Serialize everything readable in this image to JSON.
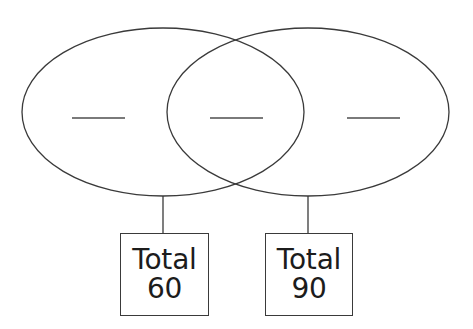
{
  "worksheet": {
    "type": "venn-diagram-fill-in-the-blank",
    "background_color": "#ffffff",
    "stroke_color": "#3a3a3a",
    "text_color": "#1c1c1c",
    "blank_line_color": "#7a7a7a"
  },
  "diagram": {
    "left_ellipse": {
      "label": "left-set-ellipse",
      "cx": 163,
      "cy": 112,
      "rx": 141,
      "ry": 84
    },
    "right_ellipse": {
      "label": "right-set-ellipse",
      "cx": 308,
      "cy": 112,
      "rx": 141,
      "ry": 84
    },
    "blanks": [
      {
        "name": "left-only-blank",
        "value": "",
        "x1": 72,
        "x2": 125,
        "y": 118
      },
      {
        "name": "intersection-blank",
        "value": "",
        "x1": 210,
        "x2": 263,
        "y": 118
      },
      {
        "name": "right-only-blank",
        "value": "",
        "x1": 347,
        "x2": 400,
        "y": 118
      }
    ],
    "connectors": [
      {
        "name": "left-connector",
        "x": 163,
        "y1": 196,
        "y2": 233
      },
      {
        "name": "right-connector",
        "x": 308,
        "y1": 196,
        "y2": 233
      }
    ]
  },
  "totals": {
    "left": {
      "word": "Total",
      "number": "60"
    },
    "right": {
      "word": "Total",
      "number": "90"
    }
  }
}
